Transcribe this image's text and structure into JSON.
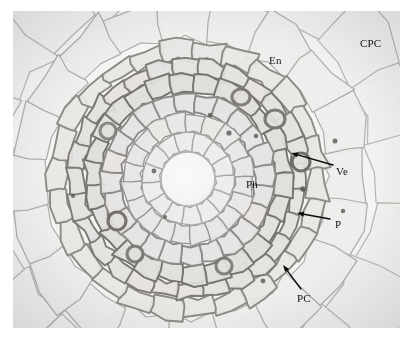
{
  "figure": {
    "domain": "Natural-Image",
    "kind": "light-microscopy-cross-section",
    "staining": "grayscale brightfield",
    "canvas": {
      "width": 415,
      "height": 344,
      "background": "#ffffff"
    },
    "image_frame": {
      "left": 13,
      "top": 11,
      "width": 387,
      "height": 317,
      "background": "#f7f7f6"
    }
  },
  "palette": {
    "paper_white": "#ffffff",
    "cell_lumen_light": "#f3f2f1",
    "cell_lumen_mid": "#e8e7e5",
    "cortex_wall": "#b9b7b5",
    "stele_wall": "#8d8b89",
    "dark_wall": "#6c6a68",
    "vessel_dark": "#5a5856",
    "pith_center": "#fafafa",
    "label_text": "#131313",
    "arrow_stroke": "#0b0b0b"
  },
  "annotations": {
    "labels": [
      {
        "id": "cpc",
        "text": "CPC",
        "x": 360,
        "y": 38,
        "meaning": "cortical parenchyma cell",
        "has_arrow": false
      },
      {
        "id": "en",
        "text": "En",
        "x": 269,
        "y": 55,
        "meaning": "endodermis",
        "has_arrow": false
      },
      {
        "id": "ve",
        "text": "Ve",
        "x": 336,
        "y": 166,
        "meaning": "vessel",
        "has_arrow": true
      },
      {
        "id": "ph",
        "text": "Ph",
        "x": 246,
        "y": 179,
        "meaning": "phloem",
        "has_arrow": false
      },
      {
        "id": "p",
        "text": "P",
        "x": 335,
        "y": 219,
        "meaning": "pericycle",
        "has_arrow": true
      },
      {
        "id": "pc",
        "text": "PC",
        "x": 297,
        "y": 293,
        "meaning": "passage cell",
        "has_arrow": true
      }
    ],
    "arrows": [
      {
        "id": "ve-arrow",
        "label": "Ve",
        "from_x": 333,
        "from_y": 165,
        "to_x": 291,
        "to_y": 153
      },
      {
        "id": "p-arrow",
        "label": "P",
        "from_x": 330,
        "from_y": 219,
        "to_x": 297,
        "to_y": 213
      },
      {
        "id": "pc-arrow",
        "label": "PC",
        "from_x": 301,
        "from_y": 289,
        "to_x": 283,
        "to_y": 265
      }
    ]
  },
  "anatomy": {
    "center_x": 175,
    "center_y": 168,
    "rings": [
      {
        "name": "pith-lumen",
        "radius_outer": 27,
        "cell_count": 1,
        "wall": "#b6b4b2",
        "fill": "#fafafa",
        "jitter": 0.02
      },
      {
        "name": "inner-xylem-ring",
        "radius_outer": 46,
        "cell_count": 14,
        "wall": "#a9a7a5",
        "fill": "#f0efed",
        "jitter": 0.16
      },
      {
        "name": "mid-stele-ring",
        "radius_outer": 66,
        "cell_count": 20,
        "wall": "#9a9896",
        "fill": "#eceae8",
        "jitter": 0.18
      },
      {
        "name": "phloem-ring",
        "radius_outer": 86,
        "cell_count": 24,
        "wall": "#8d8b89",
        "fill": "#e9e7e5",
        "jitter": 0.2
      },
      {
        "name": "vessel-ring",
        "radius_outer": 104,
        "cell_count": 26,
        "wall": "#76746f",
        "fill": "#e4e2df",
        "jitter": 0.22
      },
      {
        "name": "pericycle-ring",
        "radius_outer": 120,
        "cell_count": 28,
        "wall": "#7e7c78",
        "fill": "#e7e5e2",
        "jitter": 0.2
      },
      {
        "name": "endodermis-ring",
        "radius_outer": 139,
        "cell_count": 26,
        "wall": "#8e8c88",
        "fill": "#eceae7",
        "jitter": 0.22
      },
      {
        "name": "inner-cortex",
        "radius_outer": 182,
        "cell_count": 20,
        "wall": "#b2b0ae",
        "fill": "#f2f1ef",
        "jitter": 0.26
      },
      {
        "name": "outer-cortex",
        "radius_outer": 250,
        "cell_count": 20,
        "wall": "#bcbab8",
        "fill": "#f5f4f2",
        "jitter": 0.3
      }
    ],
    "dark_vessels": [
      {
        "cx": 288,
        "cy": 151,
        "rx": 9,
        "ry": 9,
        "shade": "#6b6966"
      },
      {
        "cx": 262,
        "cy": 108,
        "rx": 10,
        "ry": 9,
        "shade": "#76746f"
      },
      {
        "cx": 228,
        "cy": 86,
        "rx": 9,
        "ry": 8,
        "shade": "#7b7975"
      },
      {
        "cx": 104,
        "cy": 210,
        "rx": 9,
        "ry": 9,
        "shade": "#6f6d6a"
      },
      {
        "cx": 122,
        "cy": 243,
        "rx": 8,
        "ry": 8,
        "shade": "#7a7874"
      },
      {
        "cx": 95,
        "cy": 120,
        "rx": 8,
        "ry": 8,
        "shade": "#85837f"
      },
      {
        "cx": 211,
        "cy": 255,
        "rx": 8,
        "ry": 8,
        "shade": "#7d7b77"
      }
    ],
    "nuclei": [
      {
        "cx": 197,
        "cy": 104,
        "r": 2.2
      },
      {
        "cx": 216,
        "cy": 122,
        "r": 2.6
      },
      {
        "cx": 243,
        "cy": 125,
        "r": 2.3
      },
      {
        "cx": 141,
        "cy": 160,
        "r": 2.4
      },
      {
        "cx": 152,
        "cy": 206,
        "r": 2.0
      },
      {
        "cx": 290,
        "cy": 178,
        "r": 2.8
      },
      {
        "cx": 250,
        "cy": 270,
        "r": 2.4
      },
      {
        "cx": 60,
        "cy": 185,
        "r": 2.1
      },
      {
        "cx": 322,
        "cy": 130,
        "r": 2.5
      },
      {
        "cx": 330,
        "cy": 200,
        "r": 2.2
      }
    ]
  },
  "rendering": {
    "seed": 20240517,
    "grain_opacity": 0.08,
    "vignette_opacity": 0.05,
    "arrow_head_length": 7,
    "arrow_head_width": 5,
    "arrow_stroke_width": 1.4
  }
}
